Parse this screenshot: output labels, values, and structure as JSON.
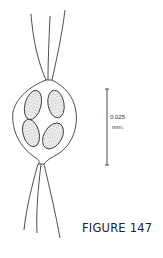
{
  "figure": {
    "caption": "FIGURE 147",
    "scale_bar": {
      "value": "0.025",
      "unit": "mm."
    },
    "illustration": "line drawing of a spindle-shaped cell with four stippled elongated bodies and bristles at both ends"
  }
}
